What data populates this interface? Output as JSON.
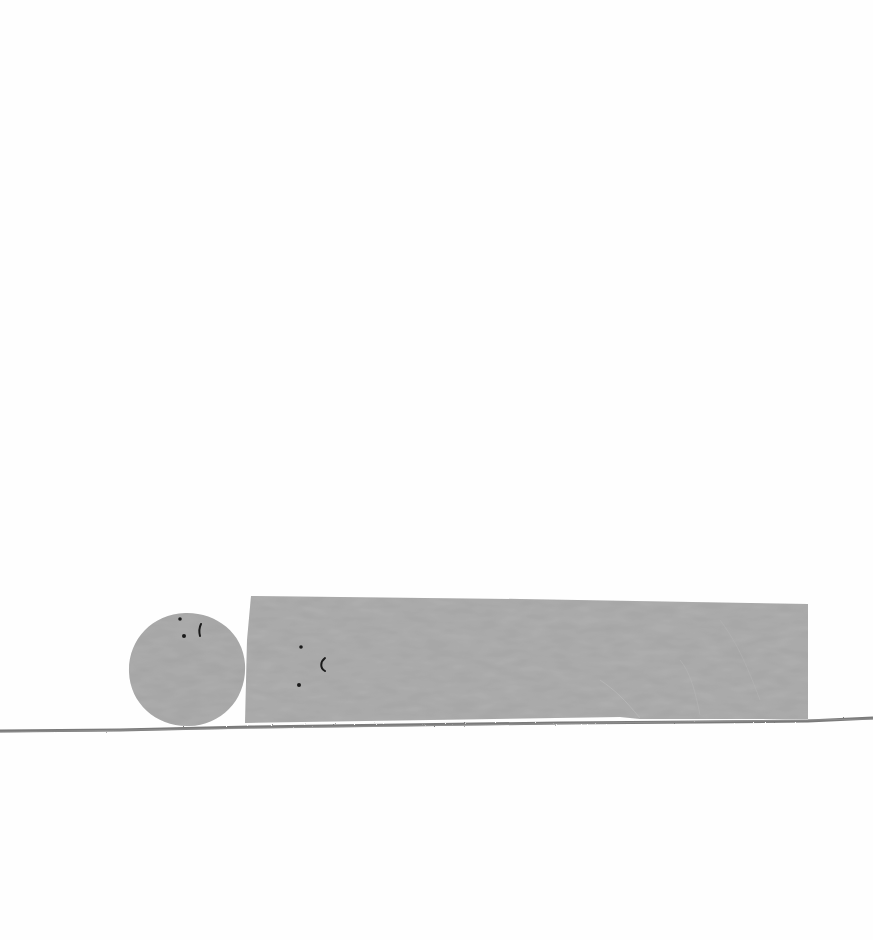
{
  "scene": {
    "description": "Minimal paper-collage illustration: a gray circle with a face resting beside a long gray rectangle with a face, lying on a pencil-drawn ground line",
    "background_color": "#fefefe",
    "shape_color": "#a3a3a3",
    "shape_texture_color": "#b0b0b0",
    "ground_line_color": "#7a7a7a",
    "face_ink_color": "#1a1a1a"
  },
  "characters": [
    {
      "name": "circle",
      "shape": "circle",
      "center": [
        187,
        669
      ],
      "radius": 58,
      "face": {
        "eyes": [
          [
            180,
            619
          ],
          [
            184,
            636
          ]
        ],
        "mouth": "vertical-stroke"
      }
    },
    {
      "name": "rectangle",
      "shape": "rectangle",
      "bounds": {
        "x": 245,
        "y": 596,
        "width": 563,
        "height": 127
      },
      "face": {
        "eyes": [
          [
            301,
            647
          ],
          [
            299,
            685
          ]
        ],
        "mouth": "crescent"
      }
    }
  ],
  "ground": {
    "y": 728,
    "x_start": 0,
    "x_end": 873
  }
}
